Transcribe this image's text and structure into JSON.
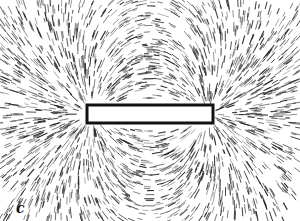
{
  "figure": {
    "label": "c",
    "colors": {
      "filings": "#222222",
      "background": "#ffffff",
      "magnet": "#ffffff"
    }
  }
}
